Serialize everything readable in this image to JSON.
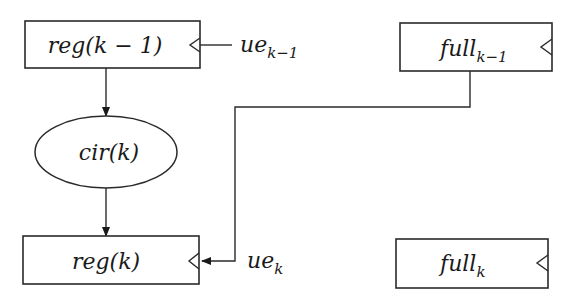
{
  "diagram": {
    "stroke_color": "#2a2a2a",
    "background": "#ffffff",
    "nodes": [
      {
        "id": "reg_km1",
        "shape": "rect",
        "label": "reg(k − 1)",
        "clock_input": true
      },
      {
        "id": "cir_k",
        "shape": "ellipse",
        "label": "cir(k)"
      },
      {
        "id": "reg_k",
        "shape": "rect",
        "label": "reg(k)",
        "clock_input": true
      },
      {
        "id": "full_km1",
        "shape": "rect",
        "label_base": "full",
        "label_sub": "k−1",
        "clock_input": true
      },
      {
        "id": "full_k",
        "shape": "rect",
        "label_base": "full",
        "label_sub": "k",
        "clock_input": true
      }
    ],
    "signals": [
      {
        "id": "ue_km1",
        "label_base": "ue",
        "label_sub": "k−1"
      },
      {
        "id": "ue_k",
        "label_base": "ue",
        "label_sub": "k"
      }
    ],
    "edges": [
      {
        "from": "reg_km1",
        "to": "cir_k",
        "arrow": true
      },
      {
        "from": "cir_k",
        "to": "reg_k",
        "arrow": true
      },
      {
        "from": "full_km1",
        "to": "reg_k.clock",
        "arrow": true,
        "label": "ue_k"
      },
      {
        "from": "ue_km1",
        "to": "reg_km1.clock",
        "arrow": false
      }
    ]
  }
}
